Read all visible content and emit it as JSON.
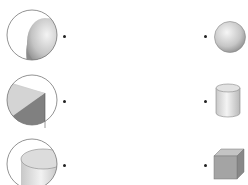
{
  "worksheet": {
    "type": "matching-exercise",
    "left_items": [
      {
        "id": "closeup-sphere",
        "description": "magnified view of curved sphere surface"
      },
      {
        "id": "closeup-cube-corner",
        "description": "magnified view of cube corner faces"
      },
      {
        "id": "closeup-cylinder",
        "description": "magnified view of cylinder top and side"
      }
    ],
    "right_items": [
      {
        "id": "sphere",
        "description": "sphere"
      },
      {
        "id": "cylinder",
        "description": "cylinder"
      },
      {
        "id": "cube",
        "description": "cube"
      }
    ],
    "colors": {
      "outline": "#666666",
      "light_gray": "#d8d8d8",
      "mid_gray": "#a8a8a8",
      "dark_gray": "#7a7a7a",
      "dot": "#222222"
    }
  }
}
